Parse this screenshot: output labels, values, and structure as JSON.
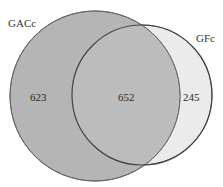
{
  "diagram": {
    "type": "venn",
    "sets": [
      {
        "name": "GACc",
        "only_count": "623",
        "fill": "#b5b5b5"
      },
      {
        "name": "GFc",
        "only_count": "245",
        "fill": "#ebebeb"
      }
    ],
    "intersection": {
      "count": "652",
      "fill": "#bcbcbc"
    },
    "stroke": "#555555"
  }
}
